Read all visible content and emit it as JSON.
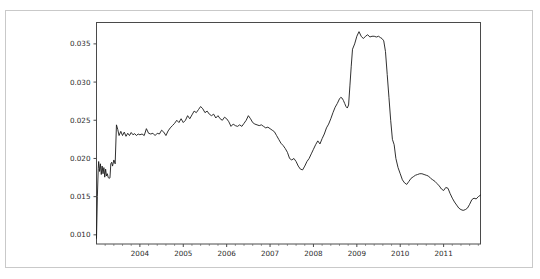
{
  "figure": {
    "background_color": "#ffffff",
    "outer_border_color": "#c9c9c9",
    "axis_color": "#4a4a4a",
    "line_color": "#1a1a1a"
  },
  "chart_data": {
    "type": "line",
    "title": "",
    "subtitle": "",
    "xlabel": "",
    "ylabel": "",
    "grid": false,
    "legend": null,
    "legend_position": "none",
    "xlim": [
      2003.0,
      2011.85
    ],
    "ylim": [
      0.0088,
      0.0378
    ],
    "xticks": [
      2004,
      2005,
      2006,
      2007,
      2008,
      2009,
      2010,
      2011
    ],
    "xtick_labels": [
      "2004",
      "2005",
      "2006",
      "2007",
      "2008",
      "2009",
      "2010",
      "2011"
    ],
    "x_minor_ticks_per_interval": 4,
    "yticks": [
      0.01,
      0.015,
      0.02,
      0.025,
      0.03,
      0.035
    ],
    "ytick_labels": [
      "0.010",
      "0.015",
      "0.020",
      "0.025",
      "0.030",
      "0.035"
    ],
    "series": [
      {
        "name": "series-1",
        "color": "#1a1a1a",
        "x": [
          2003.0,
          2003.02,
          2003.04,
          2003.05,
          2003.07,
          2003.09,
          2003.11,
          2003.13,
          2003.15,
          2003.17,
          2003.19,
          2003.21,
          2003.23,
          2003.25,
          2003.27,
          2003.29,
          2003.31,
          2003.33,
          2003.35,
          2003.37,
          2003.4,
          2003.43,
          2003.46,
          2003.49,
          2003.52,
          2003.56,
          2003.6,
          2003.64,
          2003.68,
          2003.72,
          2003.76,
          2003.8,
          2003.84,
          2003.88,
          2003.92,
          2003.96,
          2004.0,
          2004.05,
          2004.1,
          2004.15,
          2004.2,
          2004.25,
          2004.3,
          2004.35,
          2004.4,
          2004.45,
          2004.5,
          2004.55,
          2004.6,
          2004.65,
          2004.7,
          2004.75,
          2004.8,
          2004.85,
          2004.9,
          2004.95,
          2005.0,
          2005.05,
          2005.1,
          2005.15,
          2005.2,
          2005.25,
          2005.3,
          2005.35,
          2005.4,
          2005.45,
          2005.5,
          2005.55,
          2005.6,
          2005.65,
          2005.7,
          2005.75,
          2005.8,
          2005.85,
          2005.9,
          2005.95,
          2006.0,
          2006.05,
          2006.1,
          2006.15,
          2006.2,
          2006.25,
          2006.3,
          2006.35,
          2006.4,
          2006.45,
          2006.5,
          2006.55,
          2006.6,
          2006.65,
          2006.7,
          2006.75,
          2006.8,
          2006.85,
          2006.9,
          2006.95,
          2007.0,
          2007.05,
          2007.1,
          2007.15,
          2007.2,
          2007.25,
          2007.3,
          2007.35,
          2007.4,
          2007.45,
          2007.5,
          2007.55,
          2007.6,
          2007.65,
          2007.7,
          2007.75,
          2007.8,
          2007.85,
          2007.9,
          2007.95,
          2008.0,
          2008.05,
          2008.1,
          2008.15,
          2008.2,
          2008.25,
          2008.3,
          2008.35,
          2008.4,
          2008.45,
          2008.5,
          2008.55,
          2008.6,
          2008.63,
          2008.66,
          2008.69,
          2008.72,
          2008.75,
          2008.78,
          2008.81,
          2008.84,
          2008.87,
          2008.9,
          2008.95,
          2009.0,
          2009.05,
          2009.1,
          2009.15,
          2009.2,
          2009.25,
          2009.3,
          2009.35,
          2009.4,
          2009.45,
          2009.5,
          2009.55,
          2009.58,
          2009.62,
          2009.66,
          2009.7,
          2009.74,
          2009.78,
          2009.82,
          2009.86,
          2009.9,
          2009.95,
          2010.0,
          2010.05,
          2010.1,
          2010.15,
          2010.2,
          2010.25,
          2010.3,
          2010.35,
          2010.4,
          2010.45,
          2010.5,
          2010.55,
          2010.6,
          2010.65,
          2010.7,
          2010.75,
          2010.8,
          2010.85,
          2010.9,
          2010.95,
          2011.0,
          2011.05,
          2011.1,
          2011.15,
          2011.2,
          2011.25,
          2011.3,
          2011.35,
          2011.4,
          2011.45,
          2011.5,
          2011.55,
          2011.6,
          2011.65,
          2011.7,
          2011.75,
          2011.8,
          2011.85
        ],
        "y": [
          0.00955,
          0.015,
          0.0187,
          0.0196,
          0.0183,
          0.0193,
          0.0179,
          0.019,
          0.018,
          0.0188,
          0.01755,
          0.0186,
          0.0177,
          0.018,
          0.0175,
          0.0174,
          0.01745,
          0.0193,
          0.0195,
          0.019,
          0.0198,
          0.0193,
          0.0244,
          0.0238,
          0.023,
          0.02355,
          0.023,
          0.02345,
          0.0229,
          0.0233,
          0.023,
          0.0234,
          0.0231,
          0.02325,
          0.023,
          0.0232,
          0.0231,
          0.0232,
          0.023,
          0.0239,
          0.0233,
          0.0232,
          0.0233,
          0.023,
          0.0233,
          0.0232,
          0.0237,
          0.02345,
          0.023,
          0.0236,
          0.024,
          0.0243,
          0.0246,
          0.025,
          0.0247,
          0.0252,
          0.0247,
          0.025,
          0.0256,
          0.0252,
          0.0257,
          0.0262,
          0.026,
          0.0264,
          0.0268,
          0.0265,
          0.026,
          0.0262,
          0.0258,
          0.0256,
          0.0258,
          0.0253,
          0.0256,
          0.0252,
          0.025,
          0.0254,
          0.0252,
          0.0248,
          0.0242,
          0.0245,
          0.0243,
          0.0242,
          0.0244,
          0.0242,
          0.0246,
          0.025,
          0.0256,
          0.0252,
          0.0247,
          0.0245,
          0.0244,
          0.0243,
          0.0244,
          0.0242,
          0.024,
          0.0241,
          0.0239,
          0.0237,
          0.0235,
          0.023,
          0.0225,
          0.022,
          0.0217,
          0.0213,
          0.0208,
          0.02,
          0.0198,
          0.02,
          0.0196,
          0.019,
          0.0186,
          0.0185,
          0.019,
          0.0196,
          0.02,
          0.0206,
          0.0212,
          0.0218,
          0.0223,
          0.0219,
          0.0226,
          0.0232,
          0.024,
          0.0245,
          0.0252,
          0.026,
          0.0267,
          0.0272,
          0.0278,
          0.028,
          0.0279,
          0.0276,
          0.0272,
          0.0268,
          0.0266,
          0.027,
          0.0295,
          0.032,
          0.0343,
          0.035,
          0.036,
          0.0366,
          0.036,
          0.0357,
          0.036,
          0.0362,
          0.0359,
          0.036,
          0.036,
          0.0359,
          0.036,
          0.0358,
          0.0357,
          0.0354,
          0.034,
          0.031,
          0.028,
          0.025,
          0.0225,
          0.0218,
          0.02,
          0.0188,
          0.018,
          0.0172,
          0.0168,
          0.0166,
          0.017,
          0.0174,
          0.0176,
          0.0178,
          0.0179,
          0.018,
          0.018,
          0.0179,
          0.0178,
          0.0177,
          0.0174,
          0.0172,
          0.017,
          0.0167,
          0.0164,
          0.016,
          0.0158,
          0.0162,
          0.0161,
          0.0154,
          0.0148,
          0.0143,
          0.0139,
          0.0135,
          0.0133,
          0.0132,
          0.0133,
          0.0135,
          0.014,
          0.0146,
          0.0148,
          0.0147,
          0.015,
          0.0152
        ]
      }
    ]
  }
}
